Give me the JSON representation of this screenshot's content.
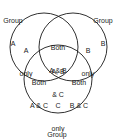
{
  "diagram": {
    "type": "venn",
    "colors": {
      "stroke": "#1a1a1a",
      "background": "#ffffff",
      "text": "#1a1a1a"
    },
    "circles": [
      {
        "id": "A",
        "cx": 44,
        "cy": 47,
        "r": 34
      },
      {
        "id": "B",
        "cx": 73,
        "cy": 47,
        "r": 34
      },
      {
        "id": "C",
        "cx": 58,
        "cy": 79,
        "r": 34
      }
    ],
    "group_labels": {
      "a": {
        "line1": "Group",
        "line2": "A"
      },
      "b": {
        "line1": "Group",
        "line2": "B"
      },
      "c": {
        "line1": "Group",
        "line2": "C"
      }
    },
    "regions": {
      "a_only": {
        "line1": "A",
        "line2": "only"
      },
      "b_only": {
        "line1": "B",
        "line2": "only"
      },
      "c_only": {
        "line1": "C",
        "line2": "only"
      },
      "ab": {
        "line1": "Both",
        "line2": "A & B"
      },
      "ac": {
        "line1": "Both",
        "line2": "A & C"
      },
      "bc": {
        "line1": "Both",
        "line2": "B & C"
      },
      "abc": {
        "line1": "A, B",
        "line2": "& C"
      }
    }
  }
}
